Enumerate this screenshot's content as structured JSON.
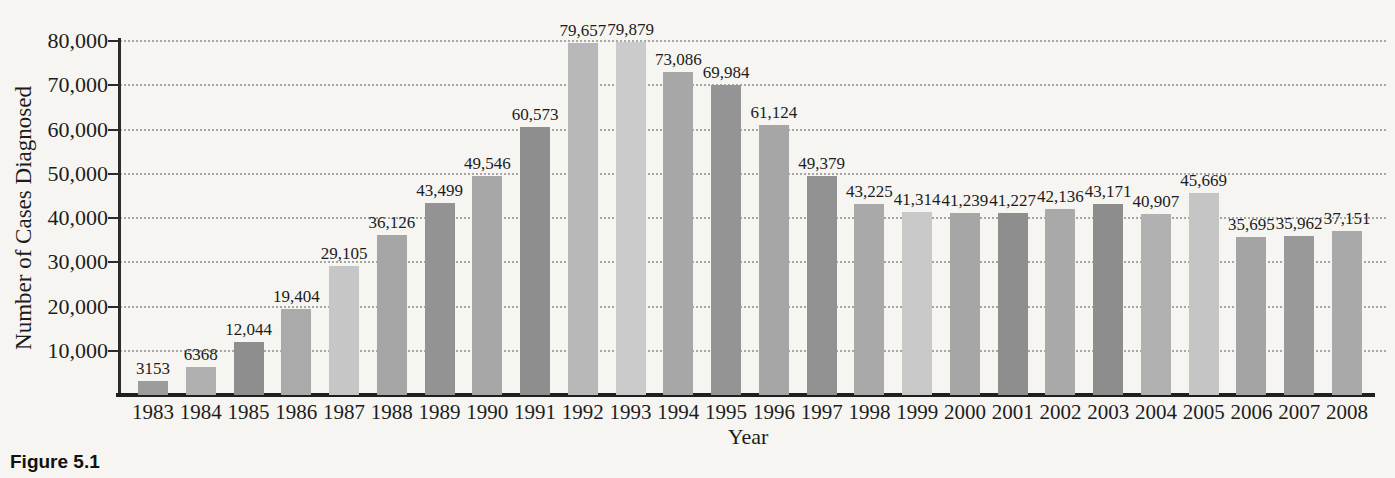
{
  "figure": {
    "caption": "Figure 5.1"
  },
  "chart_data": {
    "type": "bar",
    "title": "",
    "xlabel": "Year",
    "ylabel": "Number of Cases Diagnosed",
    "ylim": [
      0,
      80000
    ],
    "ytick_interval": 10000,
    "ytick_labels": [
      "10,000",
      "20,000",
      "30,000",
      "40,000",
      "50,000",
      "60,000",
      "70,000",
      "80,000"
    ],
    "grid": "horizontal-dotted",
    "legend": "none",
    "categories": [
      "1983",
      "1984",
      "1985",
      "1986",
      "1987",
      "1988",
      "1989",
      "1990",
      "1991",
      "1992",
      "1993",
      "1994",
      "1995",
      "1996",
      "1997",
      "1998",
      "1999",
      "2000",
      "2001",
      "2002",
      "2003",
      "2004",
      "2005",
      "2006",
      "2007",
      "2008"
    ],
    "values": [
      3153,
      6368,
      12044,
      19404,
      29105,
      36126,
      43499,
      49546,
      60573,
      79657,
      79879,
      73086,
      69984,
      61124,
      49379,
      43225,
      41314,
      41239,
      41227,
      42136,
      43171,
      40907,
      45669,
      35695,
      35962,
      37151
    ],
    "value_labels": [
      "3153",
      "6368",
      "12,044",
      "19,404",
      "29,105",
      "36,126",
      "43,499",
      "49,546",
      "60,573",
      "79,657",
      "79,879",
      "73,086",
      "69,984",
      "61,124",
      "49,379",
      "43,225",
      "41,314",
      "41,239",
      "41,227",
      "42,136",
      "43,171",
      "40,907",
      "45,669",
      "35,695",
      "35,962",
      "37,151"
    ],
    "bar_colors": [
      "#9c9c9c",
      "#b0b0b0",
      "#8e8e8e",
      "#aaaaaa",
      "#c6c6c6",
      "#a6a6a6",
      "#939393",
      "#a7a7a7",
      "#8e8e8e",
      "#b8b8b8",
      "#cbcbcb",
      "#a7a7a7",
      "#949494",
      "#a6a6a6",
      "#919191",
      "#a9a9a9",
      "#c8c8c8",
      "#a6a6a6",
      "#8e8e8e",
      "#a9a9a9",
      "#8d8d8d",
      "#b1b1b1",
      "#c5c5c5",
      "#a4a4a4",
      "#999999",
      "#a9a9a9"
    ]
  },
  "colors": {
    "background": "#f6f5f1",
    "axis": "#2b2b2b",
    "text": "#1c1c1c",
    "gridline": "#a6a6a6"
  }
}
